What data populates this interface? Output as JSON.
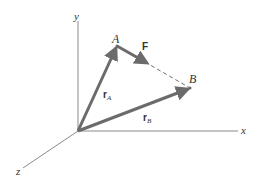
{
  "diagram": {
    "type": "3D position vectors",
    "axes": {
      "x_label": "x",
      "y_label": "y",
      "z_label": "z"
    },
    "points": {
      "A": {
        "label": "A"
      },
      "B": {
        "label": "B"
      }
    },
    "vectors": {
      "rA": {
        "symbol": "r",
        "subscript": "A",
        "from": "origin",
        "to": "A"
      },
      "rB": {
        "symbol": "r",
        "subscript": "B",
        "from": "origin",
        "to": "B"
      },
      "F": {
        "symbol": "F",
        "from": "A",
        "toward": "B",
        "line_of_action": "dashed A–B"
      }
    },
    "colors": {
      "vector": "#6b6b6b",
      "axis": "#8a8a8a",
      "text": "#333333",
      "background": "#ffffff"
    }
  }
}
